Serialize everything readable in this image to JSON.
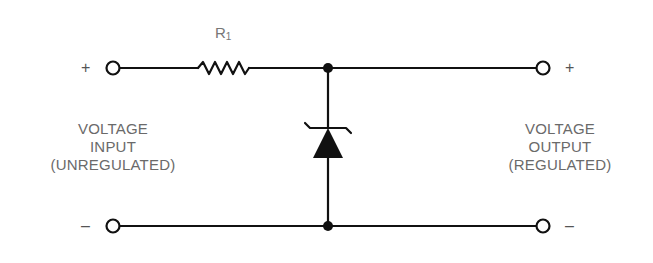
{
  "diagram": {
    "components": {
      "resistor": {
        "label": "R",
        "subscript": "1"
      },
      "zener_diode": {
        "label": ""
      }
    },
    "input": {
      "label_lines": [
        "VOLTAGE",
        "INPUT",
        "(UNREGULATED)"
      ],
      "positive_sign": "+",
      "negative_sign": "–"
    },
    "output": {
      "label_lines": [
        "VOLTAGE",
        "OUTPUT",
        "(REGULATED)"
      ],
      "positive_sign": "+",
      "negative_sign": "–"
    },
    "colors": {
      "line": "#111111",
      "text": "#6a6a6a"
    }
  }
}
